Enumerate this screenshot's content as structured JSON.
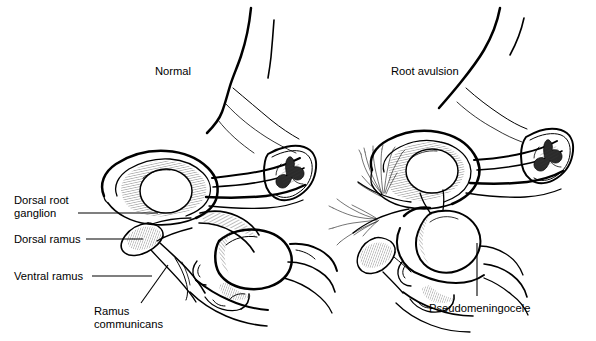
{
  "figure": {
    "type": "anatomical-line-illustration",
    "background_color": "#ffffff",
    "line_color": "#000000",
    "panels": [
      {
        "id": "left-panel",
        "title": "Normal",
        "title_position": {
          "x": 155,
          "y": 75
        }
      },
      {
        "id": "right-panel",
        "title": "Root avulsion",
        "title_position": {
          "x": 391,
          "y": 75
        }
      }
    ]
  },
  "labels": {
    "dorsal_root_ganglion_line1": "Dorsal root",
    "dorsal_root_ganglion_line2": "ganglion",
    "dorsal_ramus": "Dorsal ramus",
    "ventral_ramus": "Ventral ramus",
    "ramus_communicans_line1": "Ramus",
    "ramus_communicans_line2": "communicans",
    "pseudomeningocele": "Pseudomeningocele"
  },
  "titles": {
    "normal": "Normal",
    "root_avulsion": "Root avulsion"
  },
  "colors": {
    "ink": "#000000",
    "paper": "#ffffff",
    "hatch": "#555555",
    "solid_gray_matter": "#2b2b2b"
  }
}
